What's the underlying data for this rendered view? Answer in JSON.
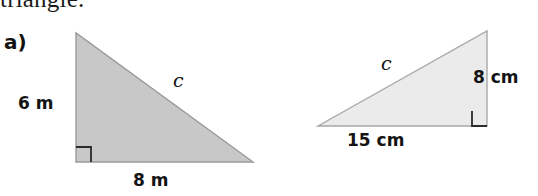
{
  "page": {
    "width": 538,
    "height": 196,
    "background": "#ffffff",
    "clipped_heading_text": "triangle."
  },
  "figures": [
    {
      "part_label": "a)",
      "shape": "right-triangle",
      "fill_color": "#c8c8c8",
      "stroke_color": "#9a9a9a",
      "right_angle_position": "bottom-left",
      "right_angle_marker": "square",
      "vertices": {
        "apex": [
          76,
          33
        ],
        "bottom_left": [
          76,
          162
        ],
        "bottom_right": [
          253,
          162
        ]
      },
      "sides": {
        "vertical_leg": "6 m",
        "horizontal_leg": "8 m",
        "hypotenuse": "c"
      },
      "units": "m",
      "vertical_leg_value": 6,
      "horizontal_leg_value": 8
    },
    {
      "part_label": "b)",
      "shape": "right-triangle",
      "fill_color": "#ebebeb",
      "stroke_color": "#a8a8a8",
      "right_angle_position": "bottom-right",
      "right_angle_marker": "square",
      "vertices": {
        "apex": [
          218,
          31
        ],
        "bottom_left": [
          49,
          126
        ],
        "bottom_right": [
          218,
          126
        ]
      },
      "sides": {
        "vertical_leg": "8 cm",
        "horizontal_leg": "15 cm",
        "hypotenuse": "c"
      },
      "units": "cm",
      "vertical_leg_value": 8,
      "horizontal_leg_value": 15
    }
  ]
}
